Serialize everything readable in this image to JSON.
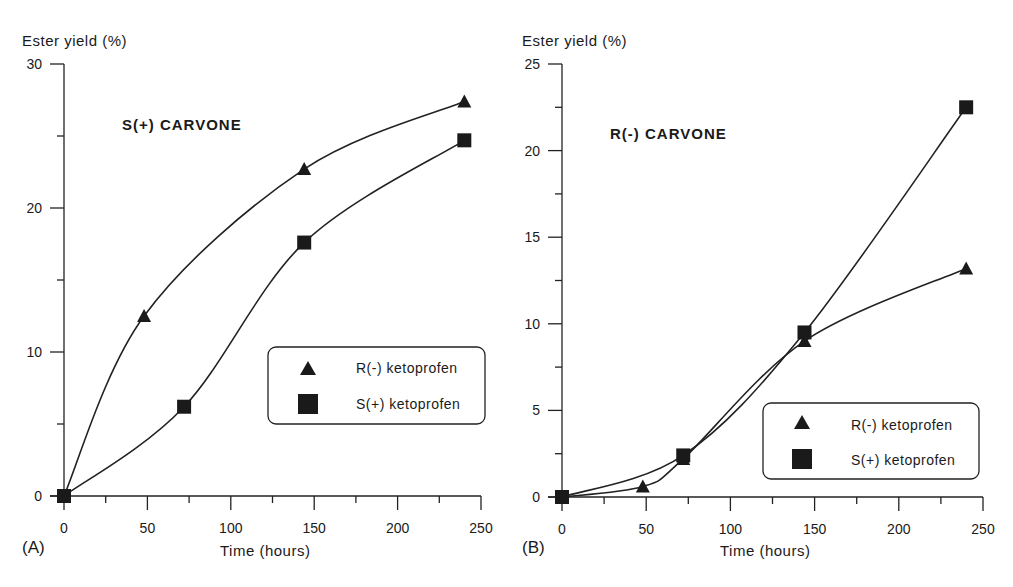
{
  "figure": {
    "panels": [
      {
        "letter": "(A)",
        "title": "S(+) CARVONE",
        "ylabel": "Ester yield (%)",
        "xlabel": "Time (hours)",
        "legend": [
          "R(-) ketoprofen",
          "S(+) ketoprofen"
        ]
      },
      {
        "letter": "(B)",
        "title": "R(-) CARVONE",
        "ylabel": "Ester yield (%)",
        "xlabel": "Time (hours)",
        "legend": [
          "R(-) ketoprofen",
          "S(+) ketoprofen"
        ]
      }
    ]
  },
  "chart_data": [
    {
      "type": "line",
      "panel": "(A)",
      "title": "S(+) CARVONE",
      "xlabel": "Time (hours)",
      "ylabel": "Ester yield (%)",
      "xlim": [
        0,
        250
      ],
      "ylim": [
        0,
        30
      ],
      "xticks": [
        0,
        50,
        100,
        150,
        200,
        250
      ],
      "yticks": [
        0,
        10,
        20,
        30
      ],
      "yminor": [
        5,
        15,
        25
      ],
      "xminor": [
        25,
        75,
        125,
        175,
        225
      ],
      "grid": false,
      "legend_position": "center-right",
      "series": [
        {
          "name": "R(-) ketoprofen",
          "marker": "triangle",
          "x": [
            0,
            48,
            144,
            240
          ],
          "y": [
            0,
            12.5,
            22.7,
            27.4
          ]
        },
        {
          "name": "S(+) ketoprofen",
          "marker": "square",
          "x": [
            0,
            72,
            144,
            240
          ],
          "y": [
            0,
            6.2,
            17.6,
            24.7
          ]
        }
      ]
    },
    {
      "type": "line",
      "panel": "(B)",
      "title": "R(-) CARVONE",
      "xlabel": "Time (hours)",
      "ylabel": "Ester yield (%)",
      "xlim": [
        0,
        250
      ],
      "ylim": [
        0,
        25
      ],
      "xticks": [
        0,
        50,
        100,
        150,
        200,
        250
      ],
      "yticks": [
        0,
        5,
        10,
        15,
        20,
        25
      ],
      "yminor": [
        2.5,
        7.5,
        12.5,
        17.5,
        22.5
      ],
      "xminor": [
        25,
        75,
        125,
        175,
        225
      ],
      "grid": false,
      "legend_position": "lower-right",
      "series": [
        {
          "name": "R(-) ketoprofen",
          "marker": "triangle",
          "x": [
            0,
            48,
            72,
            144,
            240
          ],
          "y": [
            0,
            0.6,
            2.2,
            9.0,
            13.2
          ]
        },
        {
          "name": "S(+) ketoprofen",
          "marker": "square",
          "x": [
            0,
            72,
            144,
            240
          ],
          "y": [
            0,
            2.4,
            9.5,
            22.5
          ]
        }
      ]
    }
  ]
}
